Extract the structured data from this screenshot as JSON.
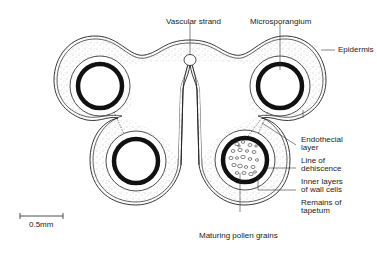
{
  "diagram": {
    "labels": {
      "vascular_strand": "Vascular strand",
      "microsporangium": "Microsporangium",
      "epidermis": "Epidermis",
      "endothecial_layer_1": "Endothecial",
      "endothecial_layer_2": "layer",
      "line_of_dehiscence_1": "Line of",
      "line_of_dehiscence_2": "dehiscence",
      "inner_layers_1": "Inner layers",
      "inner_layers_2": "of wall cells",
      "remains_tapetum_1": "Remains of",
      "remains_tapetum_2": "tapetum",
      "maturing_pollen": "Maturing pollen grains"
    },
    "scale_bar": {
      "label": "0.5mm"
    },
    "colors": {
      "line": "#222222",
      "stipple": "#888888",
      "background": "#ffffff"
    }
  }
}
